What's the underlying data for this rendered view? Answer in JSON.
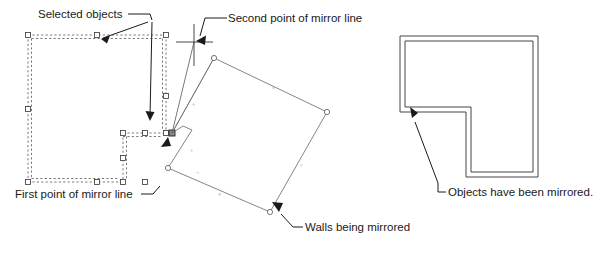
{
  "figure": {
    "background_color": "#ffffff",
    "line_color": "#333333",
    "text_color": "#1a1a1a"
  },
  "annotations": {
    "selected_objects": "Selected objects",
    "second_point": "Second point of mirror line",
    "first_point": "First point of mirror line",
    "walls_being_mirrored": "Walls being mirrored",
    "objects_mirrored": "Objects have been mirrored."
  },
  "panels": {
    "left": {
      "name": "selected-walls-panel",
      "description": "Original wall objects shown selected with dashed highlight and square grips"
    },
    "center": {
      "name": "mirror-preview-panel",
      "description": "Rotated preview of walls being mirrored about the mirror line"
    },
    "right": {
      "name": "mirrored-result-panel",
      "description": "Resulting L-shaped double-line walls after mirroring"
    }
  },
  "geometry": {
    "mirror_line": {
      "first_point": [
        172,
        133
      ],
      "second_point": [
        194,
        42
      ]
    },
    "selected_outer_rect": [
      28,
      35,
      166,
      182
    ],
    "selected_inner_notch": [
      123,
      133,
      166,
      182
    ],
    "grips": [
      [
        28,
        35
      ],
      [
        97,
        35
      ],
      [
        166,
        35
      ],
      [
        28,
        109
      ],
      [
        28,
        182
      ],
      [
        166,
        109
      ],
      [
        166,
        133
      ],
      [
        123,
        133
      ],
      [
        145,
        133
      ],
      [
        123,
        158
      ],
      [
        123,
        182
      ],
      [
        145,
        182
      ]
    ],
    "preview_polygon": [
      [
        172,
        133
      ],
      [
        214,
        58
      ],
      [
        327,
        112
      ],
      [
        270,
        212
      ],
      [
        168,
        168
      ],
      [
        192,
        130
      ],
      [
        172,
        122
      ]
    ],
    "mirrored_outline": {
      "outer": [
        [
          400,
          36
        ],
        [
          538,
          36
        ],
        [
          538,
          177
        ],
        [
          466,
          177
        ],
        [
          466,
          112
        ],
        [
          400,
          112
        ]
      ],
      "wall_thickness": 5
    }
  },
  "icons": {
    "crosshair": "crosshair-icon",
    "grip": "grip-square-icon",
    "vertex": "vertex-circle-icon",
    "leader_arrow": "leader-arrow-icon"
  }
}
